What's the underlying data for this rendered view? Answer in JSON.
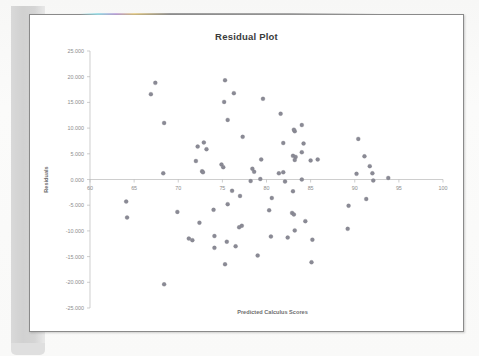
{
  "document": {
    "kind": "scanned-page",
    "page_background_color": "#ffffff",
    "page_border_color": "#8a8a8a",
    "binding_shadow_color": "#d4d4d4"
  },
  "chart_data": {
    "type": "scatter",
    "title": "Residual Plot",
    "xlabel": "Predicted Calculus Scores",
    "ylabel": "Residuals",
    "xlim": [
      60,
      100
    ],
    "ylim": [
      -25,
      25
    ],
    "xticks": [
      60,
      65,
      70,
      75,
      80,
      85,
      90,
      95,
      100
    ],
    "xtick_labels": [
      "60",
      "65",
      "70",
      "75",
      "80",
      "85",
      "90",
      "95",
      "100"
    ],
    "yticks": [
      25,
      20,
      15,
      10,
      5,
      0,
      -5,
      -10,
      -15,
      -20,
      -25
    ],
    "ytick_labels": [
      "25.000",
      "20.000",
      "15.000",
      "10.000",
      "5.000",
      "0.000",
      "-5.000",
      "-10.000",
      "-15.000",
      "-20.000",
      "-25.000"
    ],
    "grid": false,
    "legend": false,
    "zero_line": 0,
    "marker_color": "#8a8a95",
    "marker_size": 2.0,
    "series": [
      {
        "name": "Residuals",
        "points": [
          [
            64.1,
            -4.3
          ],
          [
            64.2,
            -7.4
          ],
          [
            66.9,
            16.6
          ],
          [
            67.4,
            18.8
          ],
          [
            68.4,
            11.0
          ],
          [
            68.3,
            1.2
          ],
          [
            68.4,
            -20.4
          ],
          [
            69.9,
            -6.3
          ],
          [
            71.2,
            -11.5
          ],
          [
            71.6,
            -11.8
          ],
          [
            72.0,
            3.6
          ],
          [
            72.2,
            6.4
          ],
          [
            72.4,
            -8.4
          ],
          [
            72.9,
            7.2
          ],
          [
            73.2,
            5.9
          ],
          [
            72.7,
            1.6
          ],
          [
            72.8,
            1.4
          ],
          [
            74.1,
            -11.0
          ],
          [
            74.0,
            -5.9
          ],
          [
            74.1,
            -13.3
          ],
          [
            75.3,
            19.3
          ],
          [
            75.2,
            15.1
          ],
          [
            75.6,
            11.6
          ],
          [
            74.9,
            2.9
          ],
          [
            75.1,
            2.4
          ],
          [
            75.6,
            -4.8
          ],
          [
            75.5,
            -12.1
          ],
          [
            75.3,
            -16.5
          ],
          [
            76.3,
            16.8
          ],
          [
            76.1,
            -2.2
          ],
          [
            76.5,
            -13.0
          ],
          [
            77.3,
            8.3
          ],
          [
            77.2,
            -9.0
          ],
          [
            77.0,
            -3.2
          ],
          [
            76.9,
            -9.3
          ],
          [
            78.4,
            2.1
          ],
          [
            78.6,
            1.5
          ],
          [
            78.2,
            -0.3
          ],
          [
            79.6,
            15.7
          ],
          [
            79.4,
            3.9
          ],
          [
            79.3,
            0.1
          ],
          [
            79.0,
            -14.8
          ],
          [
            80.3,
            -6.0
          ],
          [
            80.6,
            -3.6
          ],
          [
            80.5,
            -11.1
          ],
          [
            81.6,
            12.8
          ],
          [
            81.9,
            7.1
          ],
          [
            81.4,
            1.2
          ],
          [
            81.9,
            1.4
          ],
          [
            82.1,
            -0.4
          ],
          [
            82.4,
            -11.3
          ],
          [
            83.2,
            9.4
          ],
          [
            83.1,
            9.7
          ],
          [
            83.0,
            4.6
          ],
          [
            83.3,
            4.4
          ],
          [
            83.2,
            3.8
          ],
          [
            83.0,
            -2.3
          ],
          [
            82.9,
            -6.5
          ],
          [
            83.1,
            -6.8
          ],
          [
            83.2,
            -9.9
          ],
          [
            84.0,
            10.6
          ],
          [
            84.2,
            7.0
          ],
          [
            84.0,
            5.3
          ],
          [
            84.0,
            0.0
          ],
          [
            84.4,
            -8.1
          ],
          [
            85.0,
            3.7
          ],
          [
            85.2,
            -11.7
          ],
          [
            85.1,
            -16.1
          ],
          [
            85.8,
            3.9
          ],
          [
            89.3,
            -5.1
          ],
          [
            89.2,
            -9.6
          ],
          [
            90.4,
            7.9
          ],
          [
            90.2,
            1.1
          ],
          [
            91.1,
            4.5
          ],
          [
            91.3,
            -3.8
          ],
          [
            91.7,
            2.6
          ],
          [
            92.0,
            1.2
          ],
          [
            92.1,
            -0.2
          ],
          [
            93.8,
            0.3
          ]
        ]
      }
    ]
  }
}
